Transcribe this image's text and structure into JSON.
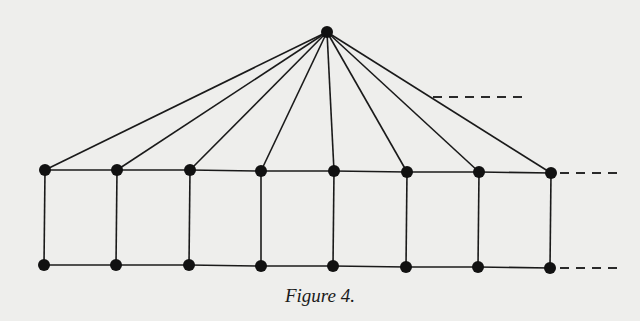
{
  "figure": {
    "caption": "Figure 4.",
    "colors": {
      "background": "#eeeeec",
      "ink": "#111111"
    },
    "apex": {
      "x": 327,
      "y": 32
    },
    "top_row": [
      {
        "x": 45,
        "y": 170
      },
      {
        "x": 117,
        "y": 170
      },
      {
        "x": 190,
        "y": 170
      },
      {
        "x": 261,
        "y": 171
      },
      {
        "x": 334,
        "y": 171
      },
      {
        "x": 407,
        "y": 172
      },
      {
        "x": 479,
        "y": 172
      },
      {
        "x": 551,
        "y": 173
      }
    ],
    "bottom_row": [
      {
        "x": 44,
        "y": 265
      },
      {
        "x": 116,
        "y": 265
      },
      {
        "x": 189,
        "y": 265
      },
      {
        "x": 261,
        "y": 266
      },
      {
        "x": 333,
        "y": 266
      },
      {
        "x": 406,
        "y": 267
      },
      {
        "x": 478,
        "y": 267
      },
      {
        "x": 550,
        "y": 268
      }
    ],
    "continuation_dashes": [
      {
        "x1": 433,
        "y1": 97,
        "x2": 525,
        "y2": 97
      },
      {
        "x1": 560,
        "y1": 173,
        "x2": 618,
        "y2": 173
      },
      {
        "x1": 560,
        "y1": 268,
        "x2": 618,
        "y2": 268
      }
    ]
  }
}
